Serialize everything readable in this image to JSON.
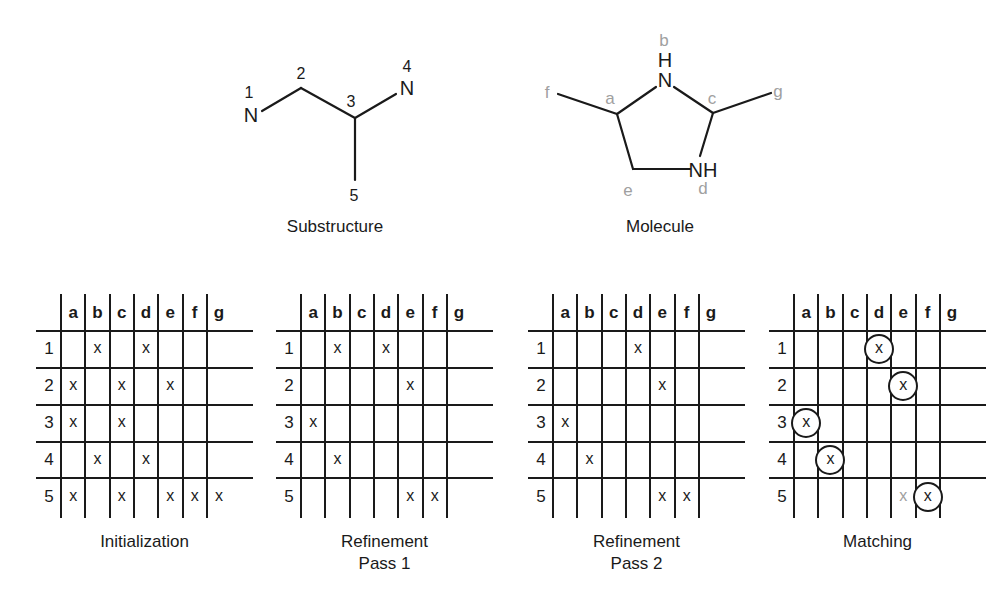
{
  "substructure": {
    "caption": "Substructure",
    "atoms": [
      {
        "id": "1",
        "element": "N"
      },
      {
        "id": "2",
        "element": ""
      },
      {
        "id": "3",
        "element": ""
      },
      {
        "id": "4",
        "element": "N"
      },
      {
        "id": "5",
        "element": ""
      }
    ],
    "labels": {
      "n1": "N",
      "n4": "N",
      "l1": "1",
      "l2": "2",
      "l3": "3",
      "l4": "4",
      "l5": "5"
    }
  },
  "molecule": {
    "caption": "Molecule",
    "labels": {
      "nb": "N",
      "hb": "H",
      "nhd": "NH",
      "a": "a",
      "b": "b",
      "c": "c",
      "d": "d",
      "e": "e",
      "f": "f",
      "g": "g"
    }
  },
  "grids": {
    "columns": [
      "a",
      "b",
      "c",
      "d",
      "e",
      "f",
      "g"
    ],
    "rows": [
      "1",
      "2",
      "3",
      "4",
      "5"
    ],
    "panels": [
      {
        "id": "initialization",
        "caption_lines": [
          "Initialization"
        ],
        "marks": [
          [
            "",
            "x",
            "",
            "x",
            "",
            "",
            ""
          ],
          [
            "x",
            "",
            "x",
            "",
            "x",
            "",
            ""
          ],
          [
            "x",
            "",
            "x",
            "",
            "",
            "",
            ""
          ],
          [
            "",
            "x",
            "",
            "x",
            "",
            "",
            ""
          ],
          [
            "x",
            "",
            "x",
            "",
            "x",
            "x",
            "x"
          ]
        ]
      },
      {
        "id": "refinement-pass-1",
        "caption_lines": [
          "Refinement",
          "Pass 1"
        ],
        "marks": [
          [
            "",
            "x",
            "",
            "x",
            "",
            "",
            ""
          ],
          [
            "",
            "",
            "",
            "",
            "x",
            "",
            ""
          ],
          [
            "x",
            "",
            "",
            "",
            "",
            "",
            ""
          ],
          [
            "",
            "x",
            "",
            "",
            "",
            "",
            ""
          ],
          [
            "",
            "",
            "",
            "",
            "x",
            "x",
            ""
          ]
        ]
      },
      {
        "id": "refinement-pass-2",
        "caption_lines": [
          "Refinement",
          "Pass 2"
        ],
        "marks": [
          [
            "",
            "",
            "",
            "x",
            "",
            "",
            ""
          ],
          [
            "",
            "",
            "",
            "",
            "x",
            "",
            ""
          ],
          [
            "x",
            "",
            "",
            "",
            "",
            "",
            ""
          ],
          [
            "",
            "x",
            "",
            "",
            "",
            "",
            ""
          ],
          [
            "",
            "",
            "",
            "",
            "x",
            "x",
            ""
          ]
        ]
      },
      {
        "id": "matching",
        "caption_lines": [
          "Matching"
        ],
        "marks": [
          [
            "",
            "",
            "",
            "X",
            "",
            "",
            ""
          ],
          [
            "",
            "",
            "",
            "",
            "X",
            "",
            ""
          ],
          [
            "X",
            "",
            "",
            "",
            "",
            "",
            ""
          ],
          [
            "",
            "X",
            "",
            "",
            "",
            "",
            ""
          ],
          [
            "",
            "",
            "",
            "",
            "x-grey",
            "X",
            ""
          ]
        ],
        "legend": {
          "X": "circled match",
          "x-grey": "unmatched candidate (grey)"
        }
      }
    ]
  },
  "colors": {
    "ink": "#1a1a1a",
    "grey_label": "#a0a0a0",
    "background": "#ffffff"
  }
}
